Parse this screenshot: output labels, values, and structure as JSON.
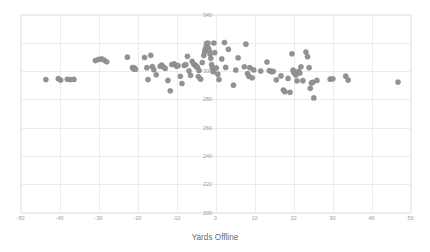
{
  "chart_data": {
    "type": "scatter",
    "title": "",
    "subtitle": "",
    "xlabel": "Yards Offline",
    "ylabel": "",
    "xlim": [
      -50,
      50
    ],
    "ylim": [
      200,
      340
    ],
    "xticks": [
      -50,
      -40,
      -30,
      -20,
      -10,
      0,
      10,
      20,
      30,
      40,
      50
    ],
    "xtick_labels": [
      "-50",
      "-40",
      "-30",
      "-20",
      "-10",
      "0",
      "10",
      "20",
      "30",
      "40",
      "50"
    ],
    "yticks": [
      200,
      220,
      240,
      260,
      280,
      300,
      320,
      340
    ],
    "ytick_labels": [
      "200",
      "220",
      "240",
      "260",
      "280",
      "300",
      "320",
      "340"
    ],
    "grid": true,
    "grid_color": "#ebebeb",
    "legend": "none",
    "marker_color": "#939393",
    "marker_size": 2.6,
    "ytick_labels_inside_plot": true,
    "points": [
      [
        -43.5,
        294.0
      ],
      [
        -40.3,
        294.6
      ],
      [
        -39.7,
        293.6
      ],
      [
        -38.0,
        294.2
      ],
      [
        -37.2,
        294.0
      ],
      [
        -36.3,
        294.1
      ],
      [
        -30.8,
        307.4
      ],
      [
        -30.0,
        308.2
      ],
      [
        -29.2,
        308.6
      ],
      [
        -28.6,
        307.8
      ],
      [
        -27.9,
        306.6
      ],
      [
        -22.6,
        309.8
      ],
      [
        -21.3,
        302.5
      ],
      [
        -21.0,
        301.6
      ],
      [
        -20.8,
        302.3
      ],
      [
        -20.5,
        301.2
      ],
      [
        -18.2,
        309.6
      ],
      [
        -17.6,
        302.4
      ],
      [
        -17.3,
        294.0
      ],
      [
        -16.6,
        311.2
      ],
      [
        -16.2,
        303.2
      ],
      [
        -15.8,
        301.0
      ],
      [
        -15.2,
        297.4
      ],
      [
        -14.2,
        303.4
      ],
      [
        -13.8,
        304.2
      ],
      [
        -13.4,
        303.0
      ],
      [
        -12.9,
        301.9
      ],
      [
        -12.2,
        293.4
      ],
      [
        -11.6,
        286.0
      ],
      [
        -11.2,
        304.6
      ],
      [
        -10.6,
        305.1
      ],
      [
        -10.0,
        303.4
      ],
      [
        -9.6,
        303.8
      ],
      [
        -9.0,
        296.3
      ],
      [
        -8.6,
        291.2
      ],
      [
        -8.0,
        304.0
      ],
      [
        -7.6,
        304.6
      ],
      [
        -7.2,
        310.4
      ],
      [
        -6.8,
        300.2
      ],
      [
        -6.4,
        297.0
      ],
      [
        -6.0,
        306.9
      ],
      [
        -5.6,
        305.0
      ],
      [
        -5.2,
        304.2
      ],
      [
        -5.0,
        303.6
      ],
      [
        -4.8,
        303.1
      ],
      [
        -4.6,
        302.4
      ],
      [
        -4.4,
        296.1
      ],
      [
        -4.2,
        300.4
      ],
      [
        -3.8,
        294.3
      ],
      [
        -3.4,
        306.0
      ],
      [
        -3.0,
        311.0
      ],
      [
        -2.8,
        313.6
      ],
      [
        -2.6,
        315.4
      ],
      [
        -2.4,
        317.0
      ],
      [
        -2.2,
        319.4
      ],
      [
        -2.0,
        319.8
      ],
      [
        -1.8,
        316.2
      ],
      [
        -1.6,
        314.4
      ],
      [
        -1.4,
        312.1
      ],
      [
        -1.2,
        309.0
      ],
      [
        -1.0,
        304.6
      ],
      [
        -0.8,
        302.0
      ],
      [
        -0.6,
        299.6
      ],
      [
        -0.4,
        319.8
      ],
      [
        -0.2,
        313.0
      ],
      [
        0.2,
        302.2
      ],
      [
        0.6,
        297.8
      ],
      [
        0.9,
        294.0
      ],
      [
        1.6,
        308.6
      ],
      [
        2.3,
        320.2
      ],
      [
        2.6,
        302.6
      ],
      [
        3.3,
        315.4
      ],
      [
        4.6,
        290.0
      ],
      [
        5.2,
        300.7
      ],
      [
        5.8,
        309.4
      ],
      [
        7.4,
        303.0
      ],
      [
        7.8,
        319.0
      ],
      [
        8.2,
        298.2
      ],
      [
        8.6,
        296.2
      ],
      [
        8.8,
        302.4
      ],
      [
        9.4,
        295.2
      ],
      [
        9.8,
        300.8
      ],
      [
        11.6,
        300.0
      ],
      [
        13.2,
        306.4
      ],
      [
        13.8,
        300.3
      ],
      [
        14.4,
        299.6
      ],
      [
        14.8,
        299.8
      ],
      [
        15.6,
        293.8
      ],
      [
        16.8,
        296.6
      ],
      [
        17.4,
        286.6
      ],
      [
        17.8,
        285.4
      ],
      [
        18.6,
        294.8
      ],
      [
        19.1,
        285.0
      ],
      [
        19.6,
        312.2
      ],
      [
        19.9,
        300.6
      ],
      [
        20.1,
        299.0
      ],
      [
        20.4,
        298.2
      ],
      [
        20.6,
        297.2
      ],
      [
        20.9,
        293.1
      ],
      [
        21.3,
        299.8
      ],
      [
        21.6,
        298.6
      ],
      [
        21.9,
        303.0
      ],
      [
        22.4,
        293.2
      ],
      [
        23.2,
        313.4
      ],
      [
        23.6,
        310.2
      ],
      [
        24.0,
        302.4
      ],
      [
        24.3,
        287.8
      ],
      [
        24.6,
        291.6
      ],
      [
        24.9,
        292.0
      ],
      [
        25.2,
        281.0
      ],
      [
        26.0,
        293.4
      ],
      [
        29.4,
        294.3
      ],
      [
        30.1,
        294.5
      ],
      [
        33.4,
        296.4
      ],
      [
        34.0,
        293.6
      ],
      [
        46.8,
        292.2
      ]
    ]
  },
  "axes": {
    "x_title": "Yards Offline"
  }
}
